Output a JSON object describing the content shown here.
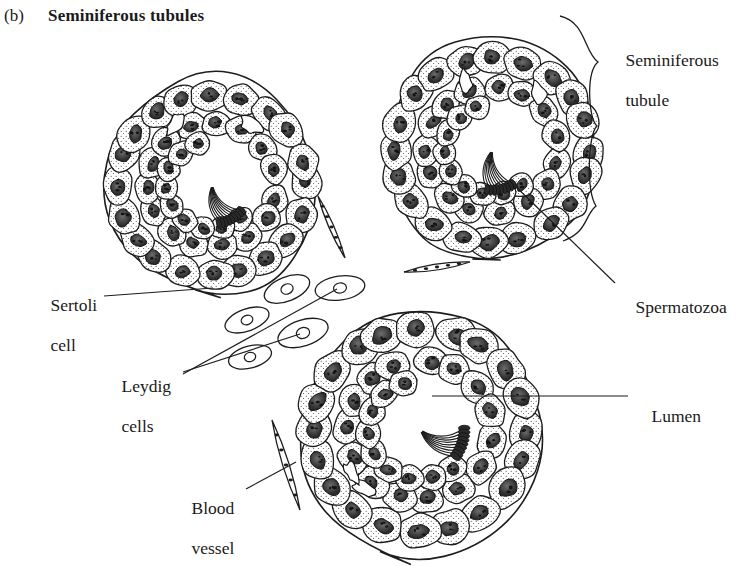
{
  "figure": {
    "panel_letter": "(b)",
    "title": "Seminiferous tubules",
    "background_color": "#ffffff",
    "ink_color": "#1d1d1d"
  },
  "labels": [
    {
      "id": "seminiferous-tubule",
      "text_line1": "Seminiferous",
      "text_line2": "tubule",
      "x": 608,
      "y": 38
    },
    {
      "id": "spermatozoa",
      "text_line1": "Spermatozoa",
      "text_line2": "",
      "x": 618,
      "y": 286
    },
    {
      "id": "sertoli-cell",
      "text_line1": "Sertoli",
      "text_line2": "cell",
      "x": 33,
      "y": 283
    },
    {
      "id": "leydig-cells",
      "text_line1": "Leydig",
      "text_line2": "cells",
      "x": 104,
      "y": 363
    },
    {
      "id": "lumen",
      "text_line1": "Lumen",
      "text_line2": "",
      "x": 634,
      "y": 385
    },
    {
      "id": "blood-vessel",
      "text_line1": "Blood",
      "text_line2": "vessel",
      "x": 174,
      "y": 478
    }
  ],
  "structures": [
    {
      "id": "tubule-upper-left",
      "name": "seminiferous tubule cross-section",
      "center_x": 212,
      "center_y": 185,
      "radius": 115
    },
    {
      "id": "tubule-upper-right",
      "name": "seminiferous tubule cross-section",
      "center_x": 492,
      "center_y": 150,
      "radius": 118
    },
    {
      "id": "tubule-lower",
      "name": "seminiferous tubule cross-section",
      "center_x": 420,
      "center_y": 430,
      "radius": 130
    },
    {
      "id": "leydig-cell-group",
      "name": "interstitial Leydig cells",
      "count": 5
    },
    {
      "id": "blood-vessel-upper",
      "name": "blood vessel",
      "x": 430,
      "y": 270
    },
    {
      "id": "blood-vessel-lower",
      "name": "blood vessel",
      "x": 280,
      "y": 470
    },
    {
      "id": "blood-vessel-mid",
      "name": "blood vessel",
      "x": 330,
      "y": 225
    }
  ],
  "leaders": {
    "sertoli_cell": "line from label to cell in lower-left wall of upper-left tubule",
    "leydig_cells": "two lines fanning from label to interstitial cells",
    "spermatozoa": "line from label up-left into upper-right tubule lumen",
    "lumen": "horizontal line from label into lower tubule lumen",
    "blood_vessel": "line from label up-right to vessel beside lower tubule",
    "seminiferous_tubule": "curly brace spanning right edge of upper-right tubule"
  }
}
